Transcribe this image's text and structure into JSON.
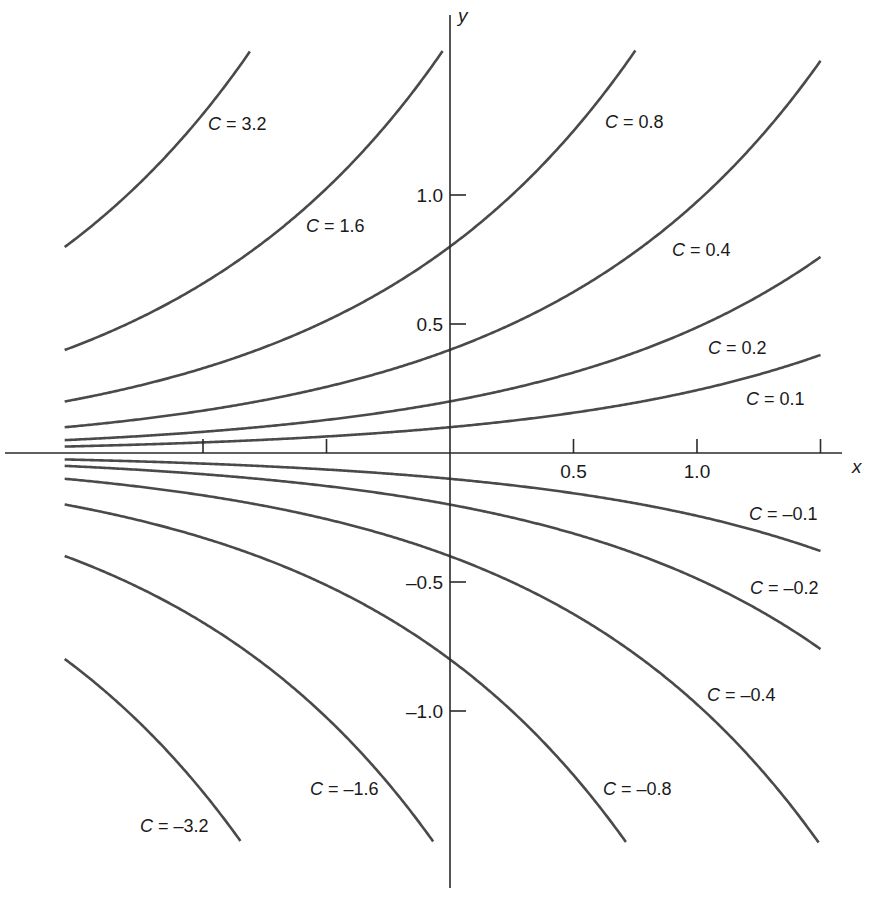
{
  "chart_data": {
    "type": "line",
    "title": "",
    "xlabel": "x",
    "ylabel": "y",
    "xlim": [
      -1.56,
      1.5
    ],
    "ylim": [
      -1.51,
      1.56
    ],
    "grid": false,
    "legend": "inline curve labels",
    "equation_form": "y = C * exp(k x), k ≈ 0.89",
    "k": 0.89,
    "x_ticks": [
      {
        "value": -1.0,
        "label": ""
      },
      {
        "value": -0.5,
        "label": ""
      },
      {
        "value": 0.5,
        "label": "0.5"
      },
      {
        "value": 1.0,
        "label": "1.0"
      },
      {
        "value": 1.5,
        "label": ""
      }
    ],
    "y_ticks": [
      {
        "value": 1.0,
        "label": "1.0"
      },
      {
        "value": 0.5,
        "label": "0.5"
      },
      {
        "value": -0.5,
        "label": "-0.5"
      },
      {
        "value": -1.0,
        "label": "-1.0"
      }
    ],
    "series": [
      {
        "name": "C = 3.2",
        "C": 3.2,
        "label_pos": [
          208,
          130
        ]
      },
      {
        "name": "C = 1.6",
        "C": 1.6,
        "label_pos": [
          306,
          232
        ]
      },
      {
        "name": "C = 0.8",
        "C": 0.8,
        "label_pos": [
          605,
          128
        ]
      },
      {
        "name": "C = 0.4",
        "C": 0.4,
        "label_pos": [
          672,
          256
        ]
      },
      {
        "name": "C = 0.2",
        "C": 0.2,
        "label_pos": [
          708,
          354
        ]
      },
      {
        "name": "C = 0.1",
        "C": 0.1,
        "label_pos": [
          746,
          405
        ]
      },
      {
        "name": "C = -0.1",
        "C": -0.1,
        "label_pos": [
          749,
          520
        ]
      },
      {
        "name": "C = -0.2",
        "C": -0.2,
        "label_pos": [
          750,
          594
        ]
      },
      {
        "name": "C = -0.4",
        "C": -0.4,
        "label_pos": [
          707,
          701
        ]
      },
      {
        "name": "C = -0.8",
        "C": -0.8,
        "label_pos": [
          603,
          795
        ]
      },
      {
        "name": "C = -1.6",
        "C": -1.6,
        "label_pos": [
          310,
          795
        ]
      },
      {
        "name": "C = -3.2",
        "C": -3.2,
        "label_pos": [
          140,
          832
        ]
      }
    ],
    "sample_points": {
      "x": [
        -1.5,
        -1.0,
        -0.5,
        0,
        0.5,
        1.0,
        1.5
      ],
      "C=0.1": [
        0.026,
        0.041,
        0.064,
        0.1,
        0.156,
        0.244,
        0.38
      ],
      "C=0.2": [
        0.053,
        0.082,
        0.128,
        0.2,
        0.312,
        0.487,
        0.76
      ],
      "C=0.4": [
        0.105,
        0.164,
        0.256,
        0.4,
        0.624,
        0.974,
        1.52
      ],
      "C=0.8": [
        0.21,
        0.33,
        0.51,
        0.8,
        1.25,
        null,
        null
      ],
      "C=1.6": [
        0.42,
        0.66,
        1.02,
        1.6,
        null,
        null,
        null
      ],
      "C=3.2": [
        0.84,
        1.31,
        null,
        null,
        null,
        null,
        null
      ]
    }
  },
  "axes": {
    "x_label": "x",
    "y_label": "y",
    "origin_px": [
      450,
      453
    ],
    "x_scale_px": 247,
    "y_scale_px": 258
  }
}
